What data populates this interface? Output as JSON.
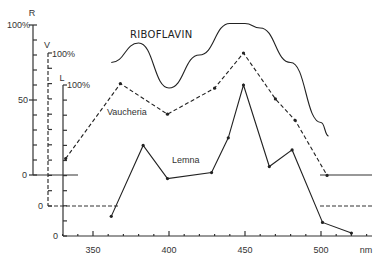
{
  "chart_data": {
    "type": "line",
    "title": "",
    "xlabel": "nm",
    "xlim": [
      315,
      535
    ],
    "x_ticks": [
      350,
      400,
      450,
      500
    ],
    "axes": [
      {
        "name": "R",
        "label": "R",
        "top_label": "100%",
        "ticks": [
          "0",
          "50",
          "100%"
        ]
      },
      {
        "name": "V",
        "label": "V",
        "top_label": "100%",
        "ticks": [
          "0"
        ]
      },
      {
        "name": "L",
        "label": "L",
        "top_label": "100%",
        "ticks": [
          "0"
        ]
      }
    ],
    "series": [
      {
        "name": "RIBOFLAVIN",
        "axis": "R",
        "style": "solid-curve",
        "x": [
          362,
          380,
          400,
          420,
          440,
          450,
          460,
          480,
          500,
          505
        ],
        "values": [
          75,
          88,
          58,
          80,
          101,
          101,
          98,
          75,
          35,
          26
        ]
      },
      {
        "name": "Vaucheria",
        "axis": "V",
        "style": "dashed",
        "x": [
          332,
          368,
          399,
          430,
          449,
          470,
          483,
          504
        ],
        "values": [
          31,
          80,
          60,
          77,
          100,
          70,
          56,
          20
        ]
      },
      {
        "name": "Lemna",
        "axis": "L",
        "style": "solid",
        "x": [
          362,
          383,
          399,
          428,
          439,
          449,
          466,
          481,
          501,
          520
        ],
        "values": [
          13,
          60,
          38,
          42,
          65,
          100,
          46,
          57,
          9,
          2
        ]
      }
    ],
    "legend": "inline labels",
    "grid": false
  }
}
